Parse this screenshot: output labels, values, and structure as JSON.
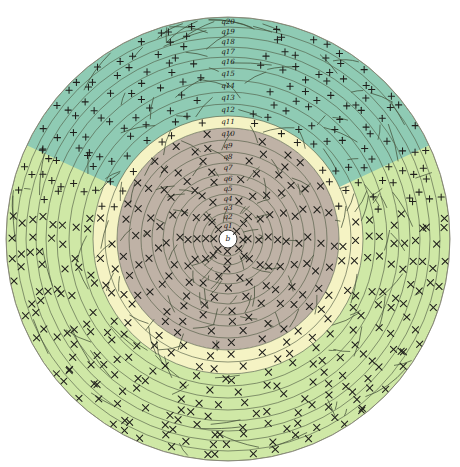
{
  "figure": {
    "type": "radial-ring-diagram",
    "title": "",
    "width": 460,
    "height": 467,
    "background": "#ffffff",
    "center": {
      "x": 228,
      "y": 239
    },
    "outer_radius": 222
  },
  "center_node": {
    "label": "b",
    "radius": 9
  },
  "rings": [
    {
      "label": "q1",
      "index": 1,
      "r_inner": 9,
      "r_outer": 17
    },
    {
      "label": "q2",
      "index": 2,
      "r_inner": 17,
      "r_outer": 26
    },
    {
      "label": "q3",
      "index": 3,
      "r_inner": 26,
      "r_outer": 35
    },
    {
      "label": "q4",
      "index": 4,
      "r_inner": 35,
      "r_outer": 45
    },
    {
      "label": "q5",
      "index": 5,
      "r_inner": 45,
      "r_outer": 55
    },
    {
      "label": "q6",
      "index": 6,
      "r_inner": 55,
      "r_outer": 65
    },
    {
      "label": "q7",
      "index": 7,
      "r_inner": 65,
      "r_outer": 76
    },
    {
      "label": "q8",
      "index": 8,
      "r_inner": 76,
      "r_outer": 87
    },
    {
      "label": "q9",
      "index": 9,
      "r_inner": 87,
      "r_outer": 99
    },
    {
      "label": "q10",
      "index": 10,
      "r_inner": 99,
      "r_outer": 111
    },
    {
      "label": "q11",
      "index": 11,
      "r_inner": 111,
      "r_outer": 123
    },
    {
      "label": "q12",
      "index": 12,
      "r_inner": 123,
      "r_outer": 135
    },
    {
      "label": "q13",
      "index": 13,
      "r_inner": 135,
      "r_outer": 147
    },
    {
      "label": "q14",
      "index": 14,
      "r_inner": 147,
      "r_outer": 159
    },
    {
      "label": "q15",
      "index": 15,
      "r_inner": 159,
      "r_outer": 171
    },
    {
      "label": "q16",
      "index": 16,
      "r_inner": 171,
      "r_outer": 182
    },
    {
      "label": "q17",
      "index": 17,
      "r_inner": 182,
      "r_outer": 192
    },
    {
      "label": "q18",
      "index": 18,
      "r_inner": 192,
      "r_outer": 202
    },
    {
      "label": "q19",
      "index": 19,
      "r_inner": 202,
      "r_outer": 212
    },
    {
      "label": "q20",
      "index": 20,
      "r_inner": 212,
      "r_outer": 222
    }
  ],
  "palette": {
    "teal": "#8FCBB4",
    "pale_yellow": "#F5F3C4",
    "light_green": "#CFE8A6",
    "taupe": "#BFB2A6",
    "mark_stroke": "#20201c",
    "ring_stroke": "#4e5a42",
    "disc_edge": "#8a8a7a",
    "background": "#ffffff"
  },
  "regions": [
    {
      "name": "inner-core",
      "color": "#BFB2A6",
      "r_from": 9,
      "r_to": 111,
      "angle_from": 0,
      "angle_to": 360
    },
    {
      "name": "mid-annulus",
      "color": "#F5F3C4",
      "r_from": 111,
      "r_to": 135,
      "angle_from": 0,
      "angle_to": 360
    },
    {
      "name": "outer-annulus",
      "color": "#CFE8A6",
      "r_from": 135,
      "r_to": 222,
      "angle_from": 0,
      "angle_to": 360
    },
    {
      "name": "top-teal-sector",
      "color": "#8FCBB4",
      "r_from": 123,
      "r_to": 222,
      "angle_from": 205,
      "angle_to": 335
    }
  ],
  "marks": {
    "cross_glyph": "x",
    "plus_glyph": "+",
    "cross_count_note": "x",
    "plus_count_note": "+"
  },
  "legend": {
    "visible": false,
    "entries": []
  },
  "chart_data": {
    "type": "pie",
    "title": "",
    "xlabel": "",
    "ylabel": "",
    "categories": [
      "q1",
      "q2",
      "q3",
      "q4",
      "q5",
      "q6",
      "q7",
      "q8",
      "q9",
      "q10",
      "q11",
      "q12",
      "q13",
      "q14",
      "q15",
      "q16",
      "q17",
      "q18",
      "q19",
      "q20"
    ],
    "values": [
      8,
      9,
      9,
      10,
      10,
      10,
      11,
      11,
      12,
      12,
      12,
      12,
      12,
      12,
      12,
      11,
      10,
      10,
      10,
      10
    ],
    "legend_position": "none",
    "grid": true
  }
}
